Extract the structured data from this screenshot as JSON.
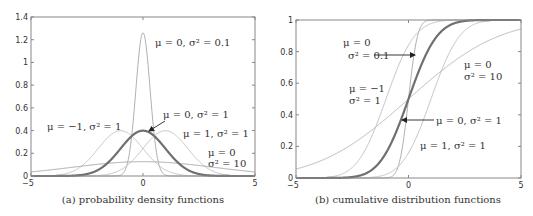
{
  "chart_data": [
    {
      "type": "line",
      "title": "",
      "caption": "(a) probability density functions",
      "xlabel": "",
      "ylabel": "",
      "xlim": [
        -5,
        5
      ],
      "ylim": [
        0,
        1.4
      ],
      "xticks": [
        -5,
        0,
        5
      ],
      "yticks": [
        0,
        0.2,
        0.4,
        0.6,
        0.8,
        1,
        1.2,
        1.4
      ],
      "ytick_labels": [
        "0",
        "0.2",
        "0.4",
        "0.6",
        "0.8",
        "1",
        "1.2",
        "1.4"
      ],
      "grid": false,
      "function": "normal_pdf",
      "series": [
        {
          "name": "μ = 0, σ² = 0.1",
          "mu": 0,
          "var": 0.1,
          "color": "#b0b0b0",
          "width": 1,
          "peak": 1.26
        },
        {
          "name": "μ = 0, σ² = 1",
          "mu": 0,
          "var": 1,
          "color": "#707070",
          "width": 2.2,
          "peak": 0.4
        },
        {
          "name": "μ = −1, σ² = 1",
          "mu": -1,
          "var": 1,
          "color": "#c4c4c4",
          "width": 1,
          "peak": 0.4
        },
        {
          "name": "μ = 1, σ² = 1",
          "mu": 1,
          "var": 1,
          "color": "#c4c4c4",
          "width": 1,
          "peak": 0.4
        },
        {
          "name": "μ = 0, σ² = 10",
          "mu": 0,
          "var": 10,
          "color": "#a8a8a8",
          "width": 1,
          "peak": 0.126
        }
      ],
      "annotations": [
        {
          "text": "μ = 0, σ² = 0.1",
          "x": 155,
          "y": 46
        },
        {
          "text": "μ = 0, σ² = 1",
          "x": 163,
          "y": 118,
          "arrow_to": [
            149,
            131
          ]
        },
        {
          "text": "μ = −1, σ² = 1",
          "x": 47,
          "y": 130
        },
        {
          "text": "μ = 1, σ² = 1",
          "x": 183,
          "y": 137
        },
        {
          "text": "μ = 0",
          "x": 208,
          "y": 156
        },
        {
          "text": "σ² = 10",
          "x": 208,
          "y": 167
        }
      ]
    },
    {
      "type": "line",
      "title": "",
      "caption": "(b) cumulative distribution functions",
      "xlabel": "",
      "ylabel": "",
      "xlim": [
        -5,
        5
      ],
      "ylim": [
        0,
        1
      ],
      "xticks": [
        -5,
        0,
        5
      ],
      "yticks": [
        0,
        0.2,
        0.4,
        0.6,
        0.8,
        1
      ],
      "ytick_labels": [
        "0",
        "0.2",
        "0.4",
        "0.6",
        "0.8",
        "1"
      ],
      "grid": false,
      "function": "normal_cdf",
      "series": [
        {
          "name": "μ = 0, σ² = 0.1",
          "mu": 0,
          "var": 0.1,
          "color": "#b0b0b0",
          "width": 1
        },
        {
          "name": "μ = 0, σ² = 1",
          "mu": 0,
          "var": 1,
          "color": "#707070",
          "width": 2.2
        },
        {
          "name": "μ = −1, σ² = 1",
          "mu": -1,
          "var": 1,
          "color": "#c4c4c4",
          "width": 1
        },
        {
          "name": "μ = 1, σ² = 1",
          "mu": 1,
          "var": 1,
          "color": "#c4c4c4",
          "width": 1
        },
        {
          "name": "μ = 0, σ² = 10",
          "mu": 0,
          "var": 10,
          "color": "#b8b8b8",
          "width": 1
        }
      ],
      "annotations": [
        {
          "text": "μ = 0",
          "x": 343,
          "y": 46
        },
        {
          "text": "σ² = 0.1",
          "x": 348,
          "y": 59,
          "arrow_from": [
            374,
            55
          ],
          "arrow_to": [
            415,
            55
          ]
        },
        {
          "text": "μ = −1",
          "x": 349,
          "y": 92
        },
        {
          "text": "σ² = 1",
          "x": 349,
          "y": 104
        },
        {
          "text": "μ = 0",
          "x": 464,
          "y": 68
        },
        {
          "text": "σ² = 10",
          "x": 464,
          "y": 80
        },
        {
          "text": "μ = 0, σ² = 1",
          "x": 436,
          "y": 124,
          "arrow_from": [
            434,
            120
          ],
          "arrow_to": [
            402,
            120
          ]
        },
        {
          "text": "μ = 1, σ² = 1",
          "x": 420,
          "y": 149
        }
      ]
    }
  ],
  "panels": {
    "a": {
      "caption": "(a) probability density functions"
    },
    "b": {
      "caption": "(b) cumulative distribution functions"
    }
  }
}
